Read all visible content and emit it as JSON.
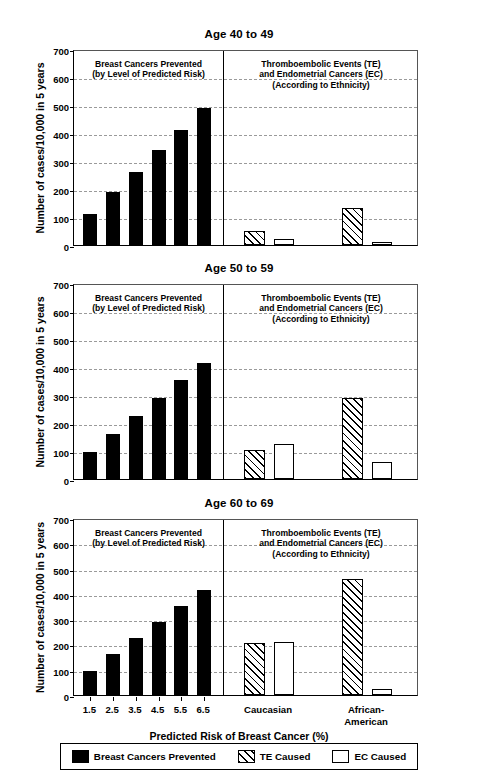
{
  "axis": {
    "ylabel": "Number of cases/10,000 in 5 years",
    "xlabel": "Predicted Risk of Breast Cancer (%)",
    "yticks": [
      "700",
      "600",
      "500",
      "400",
      "300",
      "200",
      "100",
      "0"
    ],
    "xticks": [
      "1.5",
      "2.5",
      "3.5",
      "4.5",
      "5.5",
      "6.5"
    ],
    "ethnicity_ticks": [
      "Caucasian",
      "African-\nAmerican"
    ]
  },
  "section_notes": {
    "left": "Breast Cancers Prevented\n(by Level of Predicted Risk)",
    "right": "Thromboembolic Events (TE)\nand Endometrial Cancers (EC)\n(According to Ethnicity)"
  },
  "legend": {
    "items": [
      {
        "label": "Breast Cancers Prevented",
        "style": "solid"
      },
      {
        "label": "TE Caused",
        "style": "hatch"
      },
      {
        "label": "EC Caused",
        "style": "open"
      }
    ]
  },
  "colors": {
    "prevented": "#000000",
    "te": "#000000",
    "ec": "#ffffff",
    "grid": "#9a9a9a",
    "axis": "#000000"
  },
  "chart_data": {
    "type": "bar",
    "xlabel": "Predicted Risk of Breast Cancer (%)",
    "ylabel": "Number of cases/10,000 in 5 years",
    "ylim": [
      0,
      700
    ],
    "ytick_step": 100,
    "grid": true,
    "legend_position": "bottom",
    "panels": [
      {
        "title": "Age 40 to 49",
        "left_section": {
          "note": "Breast Cancers Prevented\n(by Level of Predicted Risk)",
          "series_name": "Breast Cancers Prevented",
          "categories": [
            "1.5",
            "2.5",
            "3.5",
            "4.5",
            "5.5",
            "6.5"
          ],
          "values": [
            112,
            190,
            262,
            338,
            412,
            488
          ]
        },
        "right_section": {
          "note": "Thromboembolic Events (TE)\nand Endometrial Cancers (EC)\n(According to Ethnicity)",
          "categories": [
            "Caucasian",
            "African-American"
          ],
          "series": [
            {
              "name": "TE Caused",
              "values": [
                50,
                132
              ]
            },
            {
              "name": "EC Caused",
              "values": [
                20,
                12
              ]
            }
          ]
        }
      },
      {
        "title": "Age 50 to 59",
        "left_section": {
          "note": "Breast Cancers Prevented\n(by Level of Predicted Risk)",
          "series_name": "Breast Cancers Prevented",
          "categories": [
            "1.5",
            "2.5",
            "3.5",
            "4.5",
            "5.5",
            "6.5"
          ],
          "values": [
            97,
            162,
            226,
            290,
            353,
            416
          ]
        },
        "right_section": {
          "note": "Thromboembolic Events (TE)\nand Endometrial Cancers (EC)\n(According to Ethnicity)",
          "categories": [
            "Caucasian",
            "African-American"
          ],
          "series": [
            {
              "name": "TE Caused",
              "values": [
                102,
                291
              ]
            },
            {
              "name": "EC Caused",
              "values": [
                125,
                60
              ]
            }
          ]
        }
      },
      {
        "title": "Age 60 to 69",
        "left_section": {
          "note": "Breast Cancers Prevented\n(by Level of Predicted Risk)",
          "series_name": "Breast Cancers Prevented",
          "categories": [
            "1.5",
            "2.5",
            "3.5",
            "4.5",
            "5.5",
            "6.5"
          ],
          "values": [
            95,
            164,
            225,
            290,
            352,
            414
          ]
        },
        "right_section": {
          "note": "Thromboembolic Events (TE)\nand Endometrial Cancers (EC)\n(According to Ethnicity)",
          "categories": [
            "Caucasian",
            "African-American"
          ],
          "series": [
            {
              "name": "TE Caused",
              "values": [
                207,
                457
              ]
            },
            {
              "name": "EC Caused",
              "values": [
                210,
                22
              ]
            }
          ]
        }
      }
    ]
  }
}
